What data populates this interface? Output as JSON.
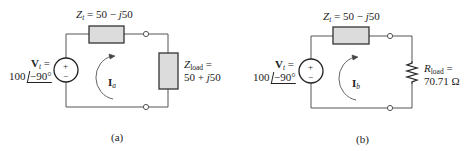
{
  "figure": {
    "panels": [
      {
        "id": "a",
        "caption": "(a)",
        "source": {
          "name_bold": "V",
          "name_sub": "t",
          "eq": " =",
          "magnitude": "100",
          "angle": "−90°",
          "plus": "+",
          "minus": "−"
        },
        "series_impedance": {
          "name": "Z",
          "name_sub": "t",
          "value": " = 50 − ",
          "j": "j",
          "imag": "50"
        },
        "load": {
          "type": "impedance",
          "name": "Z",
          "name_sub": "load",
          "eq": " =",
          "value_real": "50 + ",
          "j": "j",
          "value_imag": "50"
        },
        "current": {
          "name_bold": "I",
          "name_sub": "a"
        }
      },
      {
        "id": "b",
        "caption": "(b)",
        "source": {
          "name_bold": "V",
          "name_sub": "t",
          "eq": " =",
          "magnitude": "100",
          "angle": "−90°",
          "plus": "+",
          "minus": "−"
        },
        "series_impedance": {
          "name": "Z",
          "name_sub": "t",
          "value": " = 50 − ",
          "j": "j",
          "imag": "50"
        },
        "load": {
          "type": "resistor",
          "name": "R",
          "name_sub": "load",
          "eq": " =",
          "value": "70.71 Ω"
        },
        "current": {
          "name_bold": "I",
          "name_sub": "b"
        }
      }
    ],
    "colors": {
      "wire": "#555555",
      "box_fill": "#dcdcdc",
      "box_stroke": "#333333",
      "arrow": "#555555"
    }
  }
}
